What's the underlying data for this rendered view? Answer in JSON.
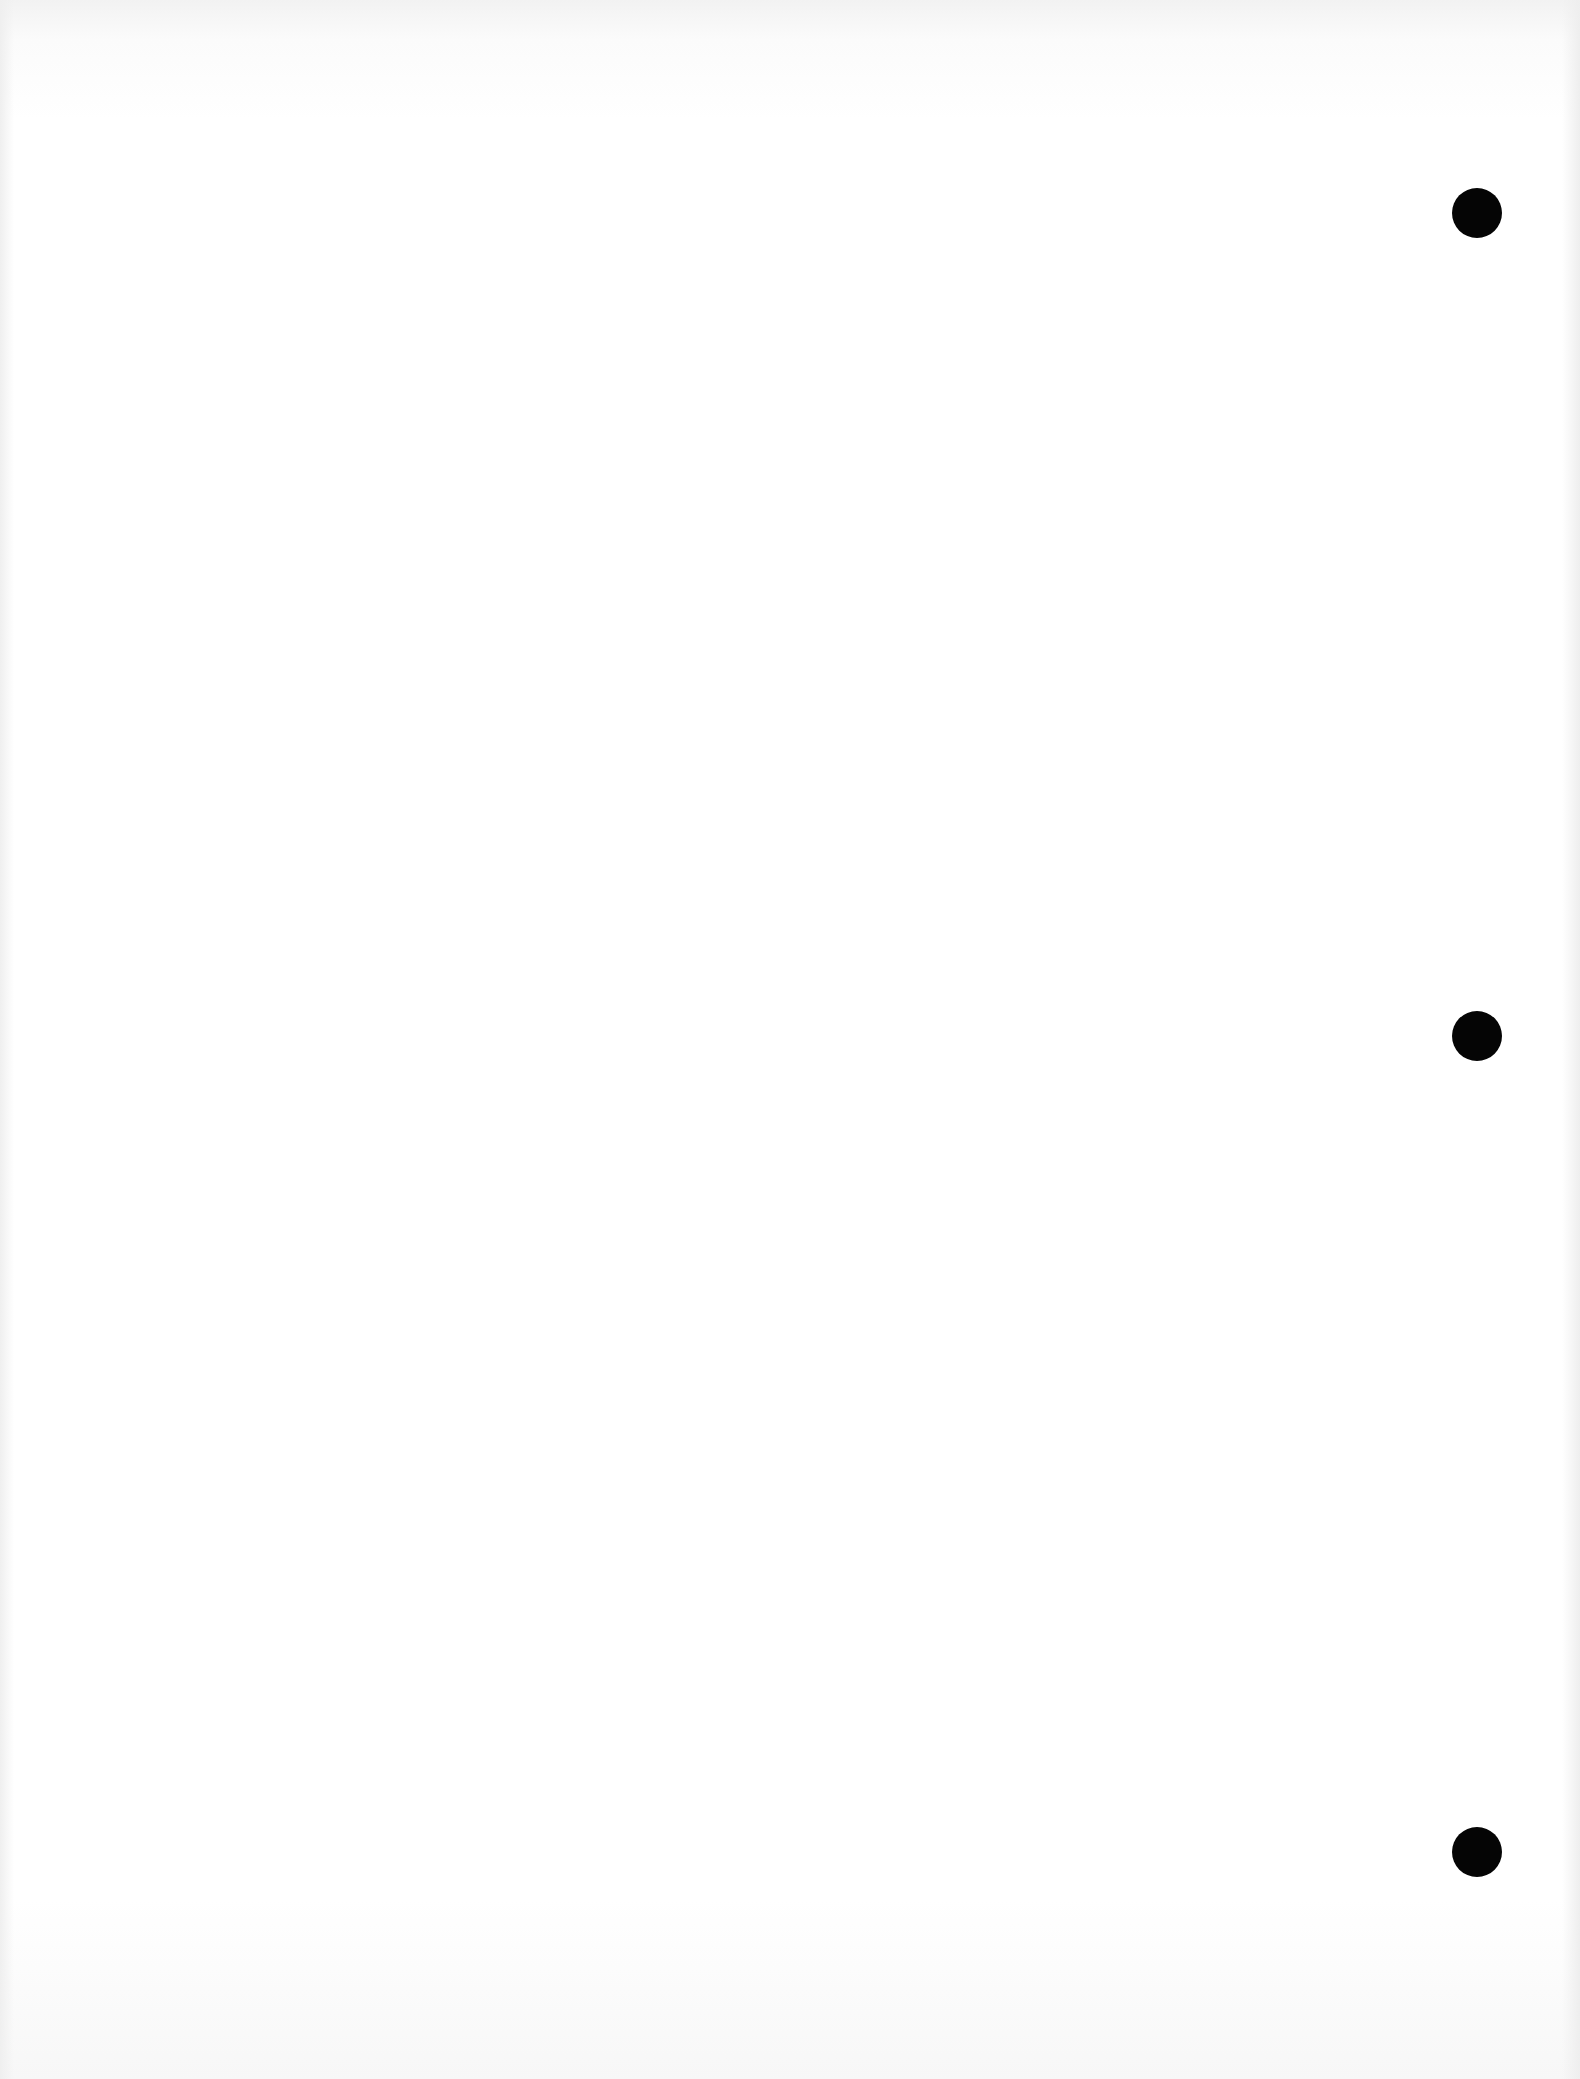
{
  "document": {
    "type": "blank scanned page",
    "text": "",
    "punch_holes": [
      {
        "x": 1477,
        "y": 213
      },
      {
        "x": 1477,
        "y": 1036
      },
      {
        "x": 1477,
        "y": 1852
      }
    ],
    "hole_color": "#050505",
    "paper_color": "#ffffff"
  }
}
